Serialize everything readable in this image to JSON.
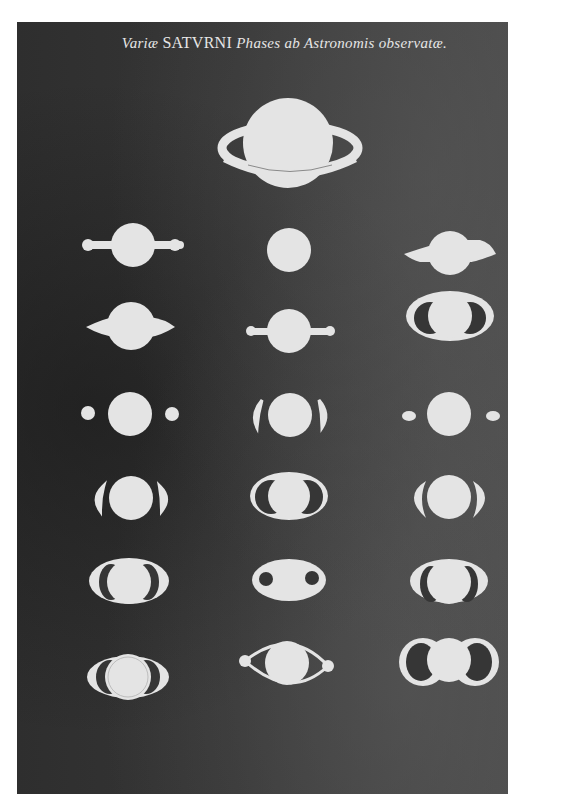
{
  "plate": {
    "title_parts": {
      "word1": "Variæ ",
      "word2": "SATVRNI",
      "word3": " Phases ab ",
      "word4": "Astronomis observatæ."
    },
    "colors": {
      "background": "#363636",
      "figure_fill": "#e4e4e4",
      "page_margin": "#ffffff"
    }
  },
  "figures": [
    {
      "id": 1,
      "row": 0,
      "col": "center",
      "description": "Globe with full tilted ring (large, top)"
    },
    {
      "id": 2,
      "row": 1,
      "col": "left",
      "description": "Globe with thin handle-like arms ending in knobs"
    },
    {
      "id": 3,
      "row": 1,
      "col": "center",
      "description": "Plain round globe"
    },
    {
      "id": 4,
      "row": 1,
      "col": "right",
      "description": "Globe with pointed wing-like extensions"
    },
    {
      "id": 5,
      "row": 2,
      "col": "left",
      "description": "Globe with pointed wing-like extensions"
    },
    {
      "id": 6,
      "row": 2,
      "col": "center",
      "description": "Globe with thin handle-like arms ending in knobs"
    },
    {
      "id": 7,
      "row": 2,
      "col": "right",
      "description": "Globe with closed ring ansae"
    },
    {
      "id": 8,
      "row": 3,
      "col": "left",
      "description": "Globe with two small detached companion orbs"
    },
    {
      "id": 9,
      "row": 3,
      "col": "center",
      "description": "Globe with crescent ansae on each side"
    },
    {
      "id": 10,
      "row": 3,
      "col": "right",
      "description": "Globe with two small irregular companions"
    },
    {
      "id": 11,
      "row": 4,
      "col": "left",
      "description": "Globe with crescent ansae on each side"
    },
    {
      "id": 12,
      "row": 4,
      "col": "center",
      "description": "Globe with closed ring ansae"
    },
    {
      "id": 13,
      "row": 4,
      "col": "right",
      "description": "Globe with wide crescent ansae"
    },
    {
      "id": 14,
      "row": 5,
      "col": "left",
      "description": "Globe with elliptical ring, dark gaps"
    },
    {
      "id": 15,
      "row": 5,
      "col": "center",
      "description": "Oval body with two dark holes"
    },
    {
      "id": 16,
      "row": 5,
      "col": "right",
      "description": "Globe with elliptical ring, dark gaps"
    },
    {
      "id": 17,
      "row": 6,
      "col": "left",
      "description": "Globe with closed ring ansae"
    },
    {
      "id": 18,
      "row": 6,
      "col": "center",
      "description": "Globe within pointed lens-shaped ring with knobs"
    },
    {
      "id": 19,
      "row": 6,
      "col": "right",
      "description": "Globe with large looped ansae"
    }
  ]
}
